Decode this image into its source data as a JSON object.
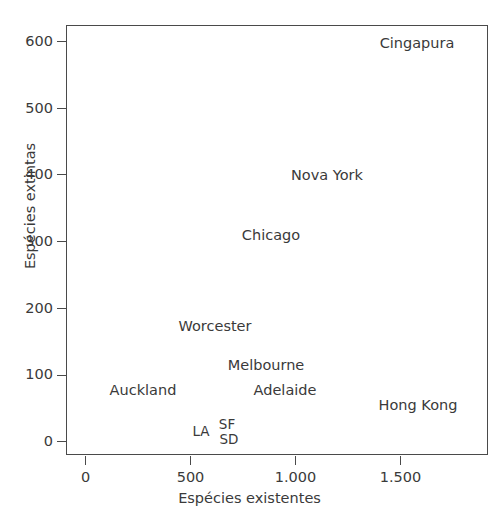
{
  "chart_data": {
    "type": "scatter",
    "title": "",
    "subtitle": "",
    "xlabel": "Espécies existentes",
    "ylabel": "Espécies extintas",
    "xlim": [
      -100,
      1910
    ],
    "ylim": [
      -30,
      615
    ],
    "grid": false,
    "legend": "none",
    "marker_style": "text-label-only",
    "locale_thousands_separator": ".",
    "xticks": [
      {
        "value": 0,
        "label": "0"
      },
      {
        "value": 500,
        "label": "500"
      },
      {
        "value": 1000,
        "label": "1.000"
      },
      {
        "value": 1500,
        "label": "1.500"
      }
    ],
    "yticks": [
      {
        "value": 0,
        "label": "0"
      },
      {
        "value": 100,
        "label": "100"
      },
      {
        "value": 200,
        "label": "200"
      },
      {
        "value": 300,
        "label": "300"
      },
      {
        "value": 400,
        "label": "400"
      },
      {
        "value": 500,
        "label": "500"
      },
      {
        "value": 600,
        "label": "600"
      }
    ],
    "points": [
      {
        "label": "Cingapura",
        "x": 1580,
        "y": 610,
        "px": 417,
        "py": 43
      },
      {
        "label": "Nova York",
        "x": 1150,
        "y": 402,
        "px": 327,
        "py": 175
      },
      {
        "label": "Chicago",
        "x": 880,
        "y": 312,
        "px": 271,
        "py": 235
      },
      {
        "label": "Worcester",
        "x": 615,
        "y": 180,
        "px": 215,
        "py": 326
      },
      {
        "label": "Melbourne",
        "x": 860,
        "y": 122,
        "px": 266,
        "py": 365
      },
      {
        "label": "Adelaide",
        "x": 950,
        "y": 85,
        "px": 285,
        "py": 390
      },
      {
        "label": "Auckland",
        "x": 270,
        "y": 98,
        "px": 143,
        "py": 390
      },
      {
        "label": "Hong Kong",
        "x": 1585,
        "y": 60,
        "px": 418,
        "py": 405
      },
      {
        "label": "LA",
        "x": 550,
        "y": 17,
        "px": 201,
        "py": 432
      },
      {
        "label": "SF",
        "x": 675,
        "y": 30,
        "px": 227,
        "py": 425
      },
      {
        "label": "SD",
        "x": 685,
        "y": 8,
        "px": 229,
        "py": 440
      }
    ],
    "colors": {
      "background": "#ffffff",
      "axis": "#4a4a4a",
      "text": "#3a3a3a"
    }
  }
}
